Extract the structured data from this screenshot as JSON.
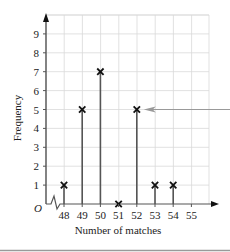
{
  "chart_data": {
    "type": "bar",
    "subtype": "vertical line graph with cross markers",
    "title": "",
    "xlabel": "Number of matches",
    "ylabel": "Frequency",
    "origin_label": "O",
    "categories": [
      48,
      49,
      50,
      51,
      52,
      53,
      54,
      55
    ],
    "values": [
      1,
      5,
      7,
      0,
      5,
      1,
      1,
      null
    ],
    "x_ticks": [
      "48",
      "49",
      "50",
      "51",
      "52",
      "53",
      "54",
      "55"
    ],
    "y_ticks": [
      "1",
      "2",
      "3",
      "4",
      "5",
      "6",
      "7",
      "8",
      "9"
    ],
    "ylim": [
      0,
      10
    ],
    "xlim": [
      47,
      56
    ],
    "grid": true,
    "axis_break": "zigzag on x-axis between origin and 48",
    "annotations": [
      {
        "type": "arrow",
        "from": "right edge",
        "points_to": {
          "x": 52,
          "y": 5
        }
      }
    ],
    "legend": null
  },
  "colors": {
    "grid": "#d9d9d9",
    "axis": "#555555",
    "line": "#555555",
    "marker": "#111111",
    "arrow": "#999999",
    "bottom_rule": "#9a9a9a"
  }
}
